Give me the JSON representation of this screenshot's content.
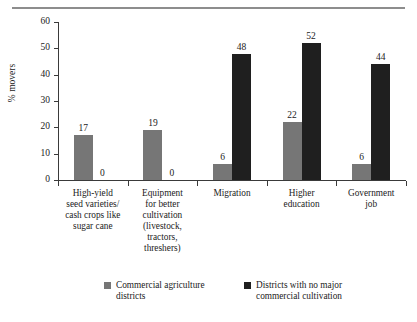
{
  "chart_data": {
    "type": "bar",
    "title": "",
    "xlabel": "",
    "ylabel": "% movers",
    "ylim": [
      0,
      60
    ],
    "yticks": [
      0,
      10,
      20,
      30,
      40,
      50,
      60
    ],
    "grid": false,
    "legend_position": "bottom",
    "categories": [
      "High-yield seed varieties/ cash crops like sugar cane",
      "Equipment for better cultivation (livestock, tractors, threshers)",
      "Migration",
      "Higher education",
      "Government job"
    ],
    "category_lines": [
      [
        "High-yield",
        "seed varieties/",
        "cash crops like",
        "sugar cane"
      ],
      [
        "Equipment",
        "for better",
        "cultivation",
        "(livestock,",
        "tractors,",
        "threshers)"
      ],
      [
        "Migration"
      ],
      [
        "Higher",
        "education"
      ],
      [
        "Government",
        "job"
      ]
    ],
    "series": [
      {
        "name": "Commercial agriculture districts",
        "name_lines": [
          "Commercial agriculture",
          "districts"
        ],
        "color": "#767676",
        "values": [
          17,
          19,
          6,
          22,
          6
        ]
      },
      {
        "name": "Districts with no major commercial cultivation",
        "name_lines": [
          "Districts with no major",
          "commercial cultivation"
        ],
        "color": "#1f1f1f",
        "values": [
          0,
          0,
          48,
          52,
          44
        ]
      }
    ]
  },
  "axis": {
    "y_tick_labels": [
      "0",
      "10",
      "20",
      "30",
      "40",
      "50",
      "60"
    ],
    "y_axis_title": "% movers"
  },
  "value_labels": {
    "light": [
      "17",
      "19",
      "6",
      "22",
      "6"
    ],
    "dark": [
      "0",
      "0",
      "48",
      "52",
      "44"
    ]
  },
  "legend": {
    "entries": [
      {
        "line1": "Commercial agriculture",
        "line2": "districts",
        "swatch": "light-gray-swatch-icon"
      },
      {
        "line1": "Districts with no major",
        "line2": "commercial cultivation",
        "swatch": "dark-swatch-icon"
      }
    ]
  },
  "colors": {
    "series_light": "#767676",
    "series_dark": "#1f1f1f",
    "axis": "#3a3a3a",
    "rule": "#8d8d8d",
    "text": "#222222",
    "background": "#ffffff"
  }
}
